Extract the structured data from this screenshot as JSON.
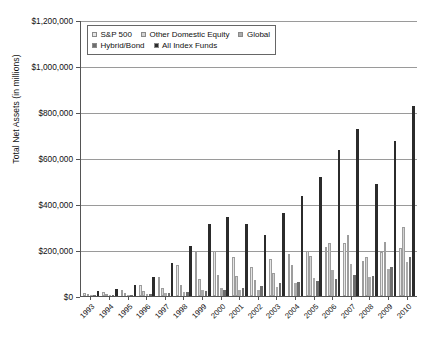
{
  "chart_data": {
    "type": "bar",
    "title": "",
    "xlabel": "",
    "ylabel": "Total Net Assets (in millions)",
    "ylim": [
      0,
      1200000
    ],
    "ytick_labels": [
      "$1,200,000",
      "$1,000,000",
      "$800,000",
      "$600,000",
      "$400,000",
      "$200,000",
      "$0"
    ],
    "ytick_values": [
      1200000,
      1000000,
      800000,
      600000,
      400000,
      200000,
      0
    ],
    "grid": true,
    "legend_position": "top-left-inside",
    "categories": [
      "1993",
      "1994",
      "1995",
      "1996",
      "1997",
      "1998",
      "1999",
      "2000",
      "2001",
      "2002",
      "2003",
      "2004",
      "2005",
      "2006",
      "2007",
      "2008",
      "2009",
      "2010"
    ],
    "series": [
      {
        "name": "S&P 500",
        "color": "#e6e6e6",
        "values": [
          12000,
          16000,
          26000,
          47000,
          84000,
          135000,
          190000,
          195000,
          170000,
          128000,
          163000,
          182000,
          196000,
          215000,
          231000,
          152000,
          190000,
          208000
        ]
      },
      {
        "name": "Other Domestic Equity",
        "color": "#d2d2d2",
        "values": [
          5000,
          7000,
          11000,
          20000,
          33000,
          50000,
          72000,
          90000,
          85000,
          68000,
          102000,
          135000,
          176000,
          230000,
          265000,
          168000,
          237000,
          300000
        ]
      },
      {
        "name": "Global",
        "color": "#ababab",
        "values": [
          3000,
          4000,
          5000,
          8000,
          12000,
          16000,
          27000,
          33000,
          27000,
          24000,
          38000,
          57000,
          80000,
          112000,
          140000,
          81000,
          118000,
          148000
        ]
      },
      {
        "name": "Hybrid/Bond",
        "color": "#6e6e6e",
        "values": [
          2000,
          3000,
          5000,
          8000,
          13000,
          18000,
          22000,
          26000,
          33000,
          45000,
          58000,
          63000,
          67000,
          76000,
          92000,
          86000,
          128000,
          168000
        ]
      },
      {
        "name": "All Index Funds",
        "color": "#2b2b2b",
        "values": [
          22000,
          30000,
          47000,
          83000,
          142000,
          219000,
          311000,
          344000,
          315000,
          265000,
          361000,
          437000,
          519000,
          633000,
          728000,
          487000,
          673000,
          824000
        ]
      }
    ]
  },
  "legend": {
    "rows": [
      [
        {
          "label": "S&P 500",
          "color": "#e6e6e6"
        },
        {
          "label": "Other Domestic Equity",
          "color": "#d2d2d2"
        },
        {
          "label": "Global",
          "color": "#ababab"
        }
      ],
      [
        {
          "label": "Hybrid/Bond",
          "color": "#6e6e6e"
        },
        {
          "label": "All Index Funds",
          "color": "#2b2b2b"
        }
      ]
    ]
  }
}
